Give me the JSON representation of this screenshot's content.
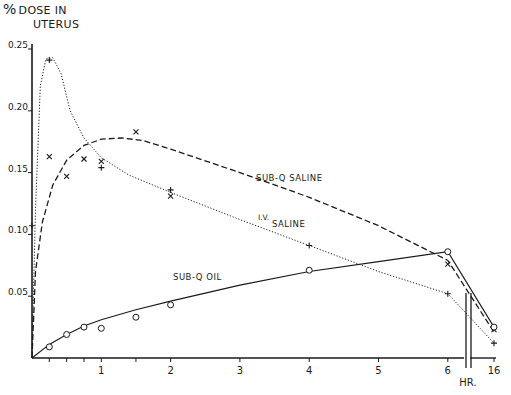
{
  "chart_data": {
    "type": "line",
    "ylabel": "% DOSE IN UTERUS",
    "xlabel": "HR.",
    "ylim": [
      0,
      0.25
    ],
    "yticks": [
      "0.05",
      "0.10",
      "0.15",
      "0.20",
      "0.25"
    ],
    "xticks": [
      "1",
      "2",
      "3",
      "4",
      "5",
      "6",
      "16"
    ],
    "x_axis_break": "between 6 and 16",
    "grid": false,
    "legend_position": "inline labels",
    "series": [
      {
        "name": "SUB-Q SALINE",
        "line_style": "dashed",
        "marker": "x",
        "x": [
          0,
          0.25,
          0.5,
          0.75,
          1,
          1.5,
          2,
          6,
          16
        ],
        "values": [
          0.003,
          0.163,
          0.147,
          0.161,
          0.159,
          0.183,
          0.131,
          0.076,
          0.023
        ],
        "label_position": {
          "x": 3.2,
          "y": 0.145
        }
      },
      {
        "name": "I.V. SALINE",
        "line_style": "dotted",
        "marker": "+",
        "x": [
          0,
          0.25,
          1,
          2,
          4,
          6,
          16
        ],
        "values": [
          0.107,
          0.241,
          0.154,
          0.136,
          0.091,
          0.052,
          0.012
        ],
        "label_position": {
          "x": 3.3,
          "y": 0.101
        }
      },
      {
        "name": "SUB-Q OIL",
        "line_style": "solid",
        "marker": "circle",
        "x": [
          0,
          0.25,
          0.5,
          0.75,
          1,
          1.5,
          2,
          4,
          6,
          16
        ],
        "values": [
          0.003,
          0.009,
          0.019,
          0.025,
          0.024,
          0.033,
          0.043,
          0.071,
          0.086,
          0.025
        ],
        "label_position": {
          "x": 1.6,
          "y": 0.064
        }
      }
    ]
  },
  "labels": {
    "title_pct": "%",
    "title_line1": "DOSE IN",
    "title_line2": "UTERUS",
    "x_unit": "HR.",
    "series_sq_saline": "SUB-Q  SALINE",
    "series_iv_1": "I.V.",
    "series_iv_2": "SALINE",
    "series_sq_oil": "SUB-Q   OIL"
  }
}
